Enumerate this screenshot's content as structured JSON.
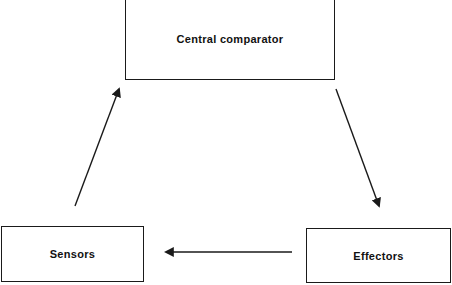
{
  "diagram": {
    "nodes": [
      {
        "id": "central",
        "label": "Central comparator"
      },
      {
        "id": "sensors",
        "label": "Sensors"
      },
      {
        "id": "effectors",
        "label": "Effectors"
      }
    ],
    "edges": [
      {
        "from": "central",
        "to": "effectors"
      },
      {
        "from": "effectors",
        "to": "sensors"
      },
      {
        "from": "sensors",
        "to": "central"
      }
    ],
    "colors": {
      "line": "#1a1a1a",
      "background": "#ffffff"
    }
  }
}
